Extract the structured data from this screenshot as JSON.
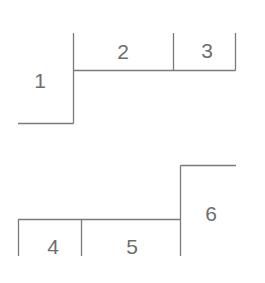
{
  "diagram": {
    "line_color": "#7a7a7a",
    "text_color": "#6e6e6e",
    "top_group": {
      "cells": [
        {
          "id": "cell-1",
          "label": "1"
        },
        {
          "id": "cell-2",
          "label": "2"
        },
        {
          "id": "cell-3",
          "label": "3"
        }
      ]
    },
    "bottom_group": {
      "cells": [
        {
          "id": "cell-4",
          "label": "4"
        },
        {
          "id": "cell-5",
          "label": "5"
        },
        {
          "id": "cell-6",
          "label": "6"
        }
      ]
    }
  }
}
